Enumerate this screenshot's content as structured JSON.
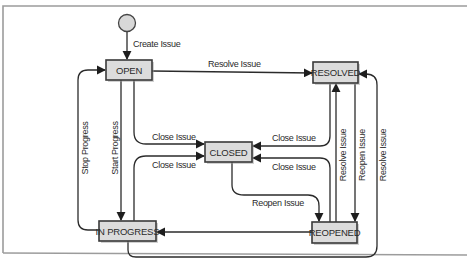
{
  "diagram": {
    "type": "state-machine",
    "start_node": {
      "label": ""
    },
    "states": [
      {
        "id": "open",
        "label": "OPEN"
      },
      {
        "id": "resolved",
        "label": "RESOLVED"
      },
      {
        "id": "closed",
        "label": "CLOSED"
      },
      {
        "id": "in_progress",
        "label": "IN PROGRESS"
      },
      {
        "id": "reopened",
        "label": "REOPENED"
      }
    ],
    "transitions": [
      {
        "from": "start",
        "to": "open",
        "label": "Create Issue"
      },
      {
        "from": "open",
        "to": "resolved",
        "label": "Resolve Issue"
      },
      {
        "from": "open",
        "to": "closed",
        "label": "Close Issue"
      },
      {
        "from": "open",
        "to": "in_progress",
        "label": "Start Progress"
      },
      {
        "from": "in_progress",
        "to": "open",
        "label": "Stop Progress"
      },
      {
        "from": "in_progress",
        "to": "closed",
        "label": "Close Issue"
      },
      {
        "from": "resolved",
        "to": "closed",
        "label": "Close Issue"
      },
      {
        "from": "reopened",
        "to": "closed",
        "label": "Close Issue"
      },
      {
        "from": "closed",
        "to": "reopened",
        "label": "Reopen Issue"
      },
      {
        "from": "reopened",
        "to": "resolved",
        "label": "Resolve Issue"
      },
      {
        "from": "resolved",
        "to": "reopened",
        "label": "Reopen Issue"
      },
      {
        "from": "in_progress",
        "to": "resolved",
        "label": "Resolve Issue"
      },
      {
        "from": "reopened",
        "to": "in_progress",
        "label": ""
      }
    ]
  }
}
